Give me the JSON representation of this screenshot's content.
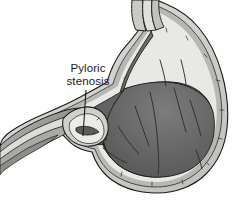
{
  "figure": {
    "name": "pyloric-stenosis-stomach-illustration",
    "type": "medical-anatomical-diagram",
    "background_color": "#fefefe",
    "width": 237,
    "height": 203
  },
  "annotations": [
    {
      "id": "pyloric-stenosis",
      "line1": "Pyloric",
      "line2": "stenosis",
      "text_color": "#1b1b1b",
      "text_x": 88,
      "text_y_line1": 72,
      "text_y_line2": 85,
      "leader_line": {
        "x1": 86,
        "y1": 90,
        "x2": 83,
        "y2": 136,
        "color": "#1a1a1a"
      }
    }
  ],
  "anatomy": {
    "parts": [
      {
        "name": "esophagus",
        "label": "Esophagus"
      },
      {
        "name": "fundus",
        "label": "Fundus"
      },
      {
        "name": "stomach-body",
        "label": "Body of stomach"
      },
      {
        "name": "gastric-lumen",
        "label": "Gastric lumen"
      },
      {
        "name": "rugae",
        "label": "Rugae (mucosal folds)"
      },
      {
        "name": "antrum",
        "label": "Antrum"
      },
      {
        "name": "pyloric-sphincter",
        "label": "Hypertrophied pyloric sphincter"
      },
      {
        "name": "pyloric-canal",
        "label": "Narrowed pyloric canal"
      },
      {
        "name": "duodenum",
        "label": "Duodenum"
      },
      {
        "name": "serosa-layer",
        "label": "Serosa / outer wall"
      },
      {
        "name": "muscularis-layer",
        "label": "Muscularis layer"
      },
      {
        "name": "mucosa-layer",
        "label": "Mucosa layer"
      }
    ]
  },
  "palette": {
    "outline": "#1a1a1a",
    "serosa_light": "#d9d9d6",
    "serosa_mid": "#c4c4c0",
    "muscularis": "#b0b0ac",
    "mucosa_pale": "#e3e3e0",
    "lumen_dark": "#6e6e6e",
    "lumen_darker": "#5d5d5d",
    "lumen_shadow": "#4f4f4f",
    "rugae_line": "#3a3a3a",
    "duodenum_fill": "#8f8f8c",
    "background": "#fefefe"
  }
}
